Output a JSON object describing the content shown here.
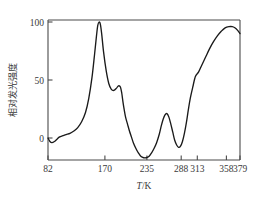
{
  "chart_data": {
    "type": "line",
    "title": "",
    "subtitle": "",
    "xlabel": "T/K",
    "xlabel_italic_part": "T",
    "xlabel_rest": "/K",
    "ylabel": "相对发光强度",
    "xlim": [
      82,
      379
    ],
    "ylim": [
      -28,
      108
    ],
    "xticks": [
      82,
      170,
      235,
      288,
      313,
      358,
      379
    ],
    "xtick_labels": [
      "82",
      "170",
      "235",
      "288",
      "313",
      "358",
      "379"
    ],
    "yticks": [
      0,
      50,
      100
    ],
    "ytick_labels": [
      "0",
      "50",
      "100"
    ],
    "grid": false,
    "legend": null,
    "series": [
      {
        "name": "相对发光强度",
        "color": "#1a1a1a",
        "x": [
          82,
          85,
          88,
          92,
          96,
          100,
          105,
          110,
          116,
          122,
          128,
          134,
          140,
          145,
          150,
          154,
          157,
          159,
          161,
          163,
          165,
          168,
          172,
          176,
          180,
          184,
          188,
          191,
          194,
          196,
          198,
          200,
          202,
          205,
          208,
          211,
          214,
          218,
          222,
          226,
          230,
          234,
          238,
          242,
          246,
          250,
          254,
          257,
          260,
          263,
          266,
          269,
          272,
          275,
          278,
          281,
          284,
          287,
          290,
          293,
          296,
          299,
          302,
          306,
          310,
          315,
          320,
          326,
          332,
          338,
          344,
          350,
          356,
          362,
          367,
          371,
          375,
          379
        ],
        "y": [
          0,
          -3,
          -4,
          -3,
          -1,
          1,
          2,
          3,
          4,
          6,
          9,
          14,
          22,
          34,
          52,
          72,
          88,
          97,
          100,
          98,
          90,
          74,
          58,
          47,
          42,
          41,
          43,
          45,
          44,
          39,
          31,
          24,
          18,
          12,
          6,
          1,
          -4,
          -9,
          -13,
          -16,
          -17,
          -17,
          -16,
          -13,
          -9,
          -4,
          3,
          10,
          16,
          20,
          21,
          18,
          12,
          5,
          -2,
          -6,
          -8,
          -7,
          -3,
          4,
          13,
          24,
          34,
          44,
          53,
          57,
          63,
          70,
          77,
          83,
          88,
          92,
          95,
          96,
          96,
          95,
          93,
          90
        ]
      }
    ],
    "annotations": [],
    "peaks": [
      {
        "label": "main-peak",
        "x": 161,
        "y": 100
      },
      {
        "label": "shoulder-peak",
        "x": 191,
        "y": 45
      },
      {
        "label": "mid-peak",
        "x": 266,
        "y": 21
      },
      {
        "label": "broad-peak",
        "x": 364,
        "y": 96
      }
    ],
    "valleys": [
      {
        "label": "start-dip",
        "x": 88,
        "y": -4
      },
      {
        "label": "deep-valley",
        "x": 232,
        "y": -17
      },
      {
        "label": "second-valley",
        "x": 284,
        "y": -8
      }
    ],
    "colors": {
      "curve": "#1a1a1a",
      "axis": "#4a4a4a",
      "text": "#3a3a3a",
      "background": "#ffffff"
    }
  }
}
